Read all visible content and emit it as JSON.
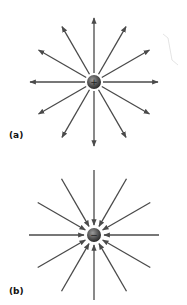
{
  "figure": {
    "panels": [
      {
        "label": "(a)",
        "charge_sign": "+",
        "field_direction": "outward",
        "line_count": 12
      },
      {
        "label": "(b)",
        "charge_sign": "−",
        "field_direction": "inward",
        "line_count": 12
      }
    ],
    "colors": {
      "arrow": "#4a4a4a",
      "charge": "#555555"
    }
  }
}
